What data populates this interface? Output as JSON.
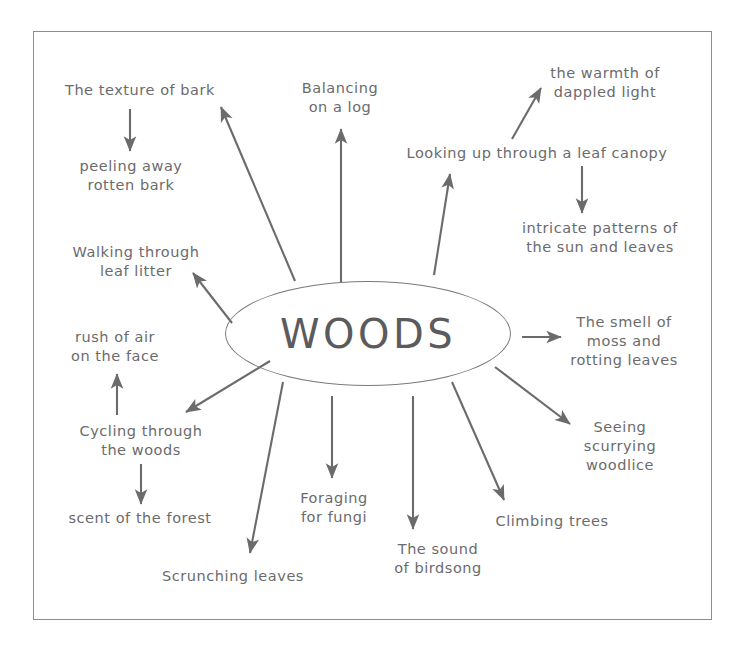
{
  "diagram": {
    "frame": {
      "border_color": "#8d8d8f"
    },
    "center": {
      "label": "WOODS",
      "shape": "ellipse",
      "text_color": "#5b5b5d",
      "stroke_color": "#7b7b7d"
    },
    "connector_color": "#6b6b6d",
    "text_color": "#6b6b6d",
    "nodes": [
      {
        "id": "texture-of-bark",
        "label": "The texture of bark"
      },
      {
        "id": "peeling-away-rotten-bark",
        "label": "peeling away\nrotten bark"
      },
      {
        "id": "balancing-on-a-log",
        "label": "Balancing\non a log"
      },
      {
        "id": "warmth-of-dappled-light",
        "label": "the warmth of\ndappled light"
      },
      {
        "id": "looking-up-through-a-leaf-canopy",
        "label": "Looking up through a leaf canopy"
      },
      {
        "id": "intricate-patterns",
        "label": "intricate patterns of\nthe sun and leaves"
      },
      {
        "id": "walking-through-leaf-litter",
        "label": "Walking through\nleaf litter"
      },
      {
        "id": "rush-of-air-on-the-face",
        "label": "rush of air\non the face"
      },
      {
        "id": "cycling-through-the-woods",
        "label": "Cycling through\nthe woods"
      },
      {
        "id": "scent-of-the-forest",
        "label": "scent of the forest"
      },
      {
        "id": "scrunching-leaves",
        "label": "Scrunching leaves"
      },
      {
        "id": "foraging-for-fungi",
        "label": "Foraging\nfor fungi"
      },
      {
        "id": "the-sound-of-birdsong",
        "label": "The sound\nof birdsong"
      },
      {
        "id": "climbing-trees",
        "label": "Climbing trees"
      },
      {
        "id": "seeing-scurrying-woodlice",
        "label": "Seeing\nscurrying\nwoodlice"
      },
      {
        "id": "smell-of-moss-and-rotting-leaves",
        "label": "The smell of\nmoss and\nrotting leaves"
      }
    ],
    "edges": [
      {
        "from": "WOODS",
        "to": "The texture of bark"
      },
      {
        "from": "The texture of bark",
        "to": "peeling away rotten bark"
      },
      {
        "from": "WOODS",
        "to": "Balancing on a log"
      },
      {
        "from": "WOODS",
        "to": "Looking up through a leaf canopy"
      },
      {
        "from": "Looking up through a leaf canopy",
        "to": "the warmth of dappled light"
      },
      {
        "from": "Looking up through a leaf canopy",
        "to": "intricate patterns of the sun and leaves"
      },
      {
        "from": "WOODS",
        "to": "Walking through leaf litter"
      },
      {
        "from": "WOODS",
        "to": "Cycling through the woods"
      },
      {
        "from": "Cycling through the woods",
        "to": "rush of air on the face"
      },
      {
        "from": "Cycling through the woods",
        "to": "scent of the forest"
      },
      {
        "from": "WOODS",
        "to": "Scrunching leaves"
      },
      {
        "from": "WOODS",
        "to": "Foraging for fungi"
      },
      {
        "from": "WOODS",
        "to": "The sound of birdsong"
      },
      {
        "from": "WOODS",
        "to": "Climbing trees"
      },
      {
        "from": "WOODS",
        "to": "Seeing scurrying woodlice"
      },
      {
        "from": "WOODS",
        "to": "The smell of moss and rotting leaves"
      }
    ]
  }
}
